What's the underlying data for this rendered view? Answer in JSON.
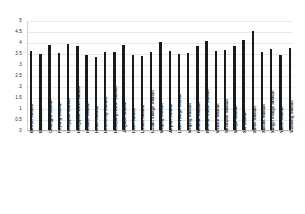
{
  "chart_data": {
    "type": "bar",
    "title": "",
    "xlabel": "",
    "ylabel": "",
    "ylim": [
      0,
      5
    ],
    "yticks": [
      "0",
      "0.5",
      "1",
      "1.5",
      "2",
      "2.5",
      "3",
      "3.5",
      "4",
      "4.5",
      "5"
    ],
    "grid": true,
    "legend": "none",
    "bar_color": "#1a1a1a",
    "categories": [
      "Bao'an Station",
      "Bihu Station",
      "Changpo Station",
      "Fuyong Station",
      "Hongqiao Station",
      "Hongqiao North Station",
      "Hualian Station",
      "Hubin Station",
      "Huocheng Station",
      "Huaqiang North Station",
      "Jingtian Station",
      "Lixin Station",
      "Luohu Station",
      "Luobu Village Station",
      "Meijing Station",
      "Airport Station",
      "Lixin Village Station",
      "Meijing Station",
      "Renmin Station",
      "Renmin South Station",
      "Meilian Station",
      "Shenwan Station",
      "Weijin Station",
      "Xili Station",
      "Xinhe Station",
      "Xiasha Station",
      "Xingyi Village Station",
      "Yinhe Station",
      "Yuanling Station"
    ],
    "values": [
      3.6,
      3.45,
      3.85,
      3.5,
      3.9,
      3.8,
      3.4,
      3.3,
      3.55,
      3.55,
      3.85,
      3.4,
      3.35,
      3.55,
      4.0,
      3.6,
      3.45,
      3.5,
      3.8,
      4.05,
      3.6,
      3.65,
      3.8,
      4.1,
      4.5,
      3.55,
      3.7,
      3.4,
      3.75
    ]
  }
}
